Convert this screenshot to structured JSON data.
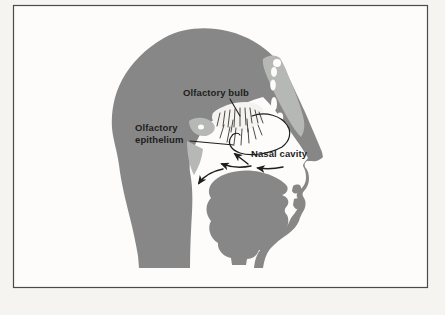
{
  "figure": {
    "type": "anatomical-diagram",
    "labels": {
      "olfactory_bulb": "Olfactory bulb",
      "olfactory_epithelium": [
        "Olfactory",
        "epithelium"
      ],
      "nasal_cavity": "Nasal cavity"
    },
    "colors": {
      "outer_background": "#f6f4f0",
      "panel_background": "#fdfcfa",
      "frame_border": "#4a4a4a",
      "head_fill": "#878787",
      "bone_fill": "#b5b8b5",
      "cavity_fill": "#fdfcfa",
      "bulb_fill": "#f4f3f0",
      "line_color": "#1e1e1e"
    }
  }
}
